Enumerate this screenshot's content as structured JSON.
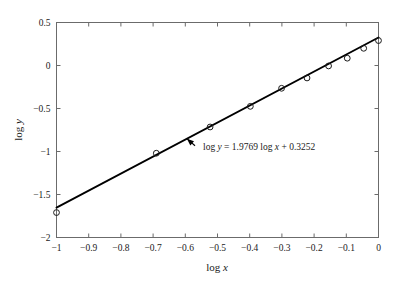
{
  "chart_data": {
    "type": "scatter",
    "title": "",
    "subtitle": "",
    "xlabel": "log x",
    "ylabel": "log y",
    "xlim": [
      -1,
      0
    ],
    "ylim": [
      -2,
      0.5
    ],
    "grid": false,
    "legend": null,
    "x_ticks": [
      -1,
      -0.9,
      -0.8,
      -0.7,
      -0.6,
      -0.5,
      -0.4,
      -0.3,
      -0.2,
      -0.1,
      0
    ],
    "x_tick_labels": [
      "-1",
      "-0.9",
      "-0.8",
      "-0.7",
      "-0.6",
      "-0.5",
      "-0.4",
      "-0.3",
      "-0.2",
      "-0.1",
      "0"
    ],
    "y_ticks": [
      -2,
      -1.5,
      -1,
      -0.5,
      0,
      0.5
    ],
    "y_tick_labels": [
      "-2",
      "-1.5",
      "-1",
      "-0.5",
      "0",
      "0.5"
    ],
    "series": [
      {
        "name": "data points",
        "marker": "open-circle",
        "color": "#1a1a1a",
        "x": [
          -1.0,
          -0.69,
          -0.523,
          -0.398,
          -0.301,
          -0.222,
          -0.155,
          -0.097,
          -0.046,
          0.0
        ],
        "y": [
          -1.71,
          -1.02,
          -0.715,
          -0.475,
          -0.265,
          -0.145,
          -0.005,
          0.085,
          0.2,
          0.29
        ]
      },
      {
        "name": "regression line",
        "type": "line",
        "color": "#000000",
        "slope": 1.9769,
        "intercept": 0.3252,
        "x_endpoints": [
          -1.0,
          0.0
        ],
        "y_endpoints": [
          -1.6517,
          0.3252
        ]
      }
    ],
    "annotations": [
      {
        "text": "log y = 1.9769 log x + 0.3252",
        "x": 1.9769,
        "intercept": 0.3252,
        "point_to_x": -0.595,
        "point_to_y": -0.851,
        "label_x": -0.545,
        "label_y": -0.98
      }
    ]
  },
  "axes": {
    "x_title": "log x",
    "y_title": "log y",
    "equation_prefix": "log",
    "equation_y": "y",
    "equation_eq": "=",
    "equation_slope": "1.9769",
    "equation_logx": "log",
    "equation_x": "x",
    "equation_plus": "+",
    "equation_intercept": "0.3252"
  },
  "colors": {
    "frame": "#6b6b6b",
    "line": "#000000",
    "marker_stroke": "#1a1a1a",
    "text": "#1a1a1a",
    "background": "#ffffff"
  }
}
